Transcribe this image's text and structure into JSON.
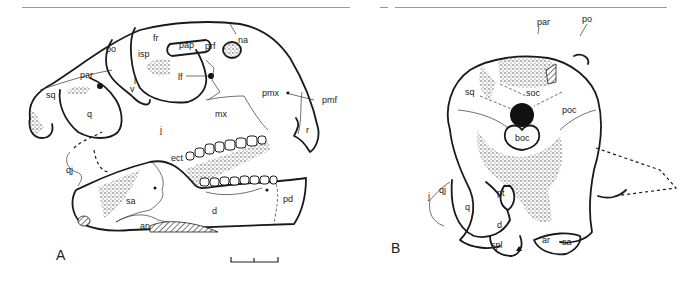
{
  "figure": {
    "panels": [
      {
        "id": "A",
        "label": "A",
        "view": "lateral",
        "bone_labels": {
          "po": "po",
          "sq": "sq",
          "par": "par",
          "isp": "isp",
          "fr": "fr",
          "pap": "pap",
          "prf": "prf",
          "na": "na",
          "lf": "lf",
          "l": "l",
          "v": "v",
          "pmx": "pmx",
          "pmf": "pmf",
          "q": "q",
          "j": "j",
          "mx": "mx",
          "r": "r",
          "qj": "qj",
          "ect": "ect",
          "sa": "sa",
          "d": "d",
          "pd": "pd",
          "an": "an"
        },
        "scale_bar": "scale-bar"
      },
      {
        "id": "B",
        "label": "B",
        "view": "posterior",
        "bone_labels": {
          "par": "par",
          "po": "po",
          "sq": "sq",
          "soc": "soc",
          "poc": "poc",
          "boc": "boc",
          "j": "j",
          "qj": "qj",
          "q": "q",
          "pt": "pt",
          "d": "d",
          "spl": "spl",
          "ar": "ar",
          "sa": "sa"
        }
      }
    ]
  }
}
